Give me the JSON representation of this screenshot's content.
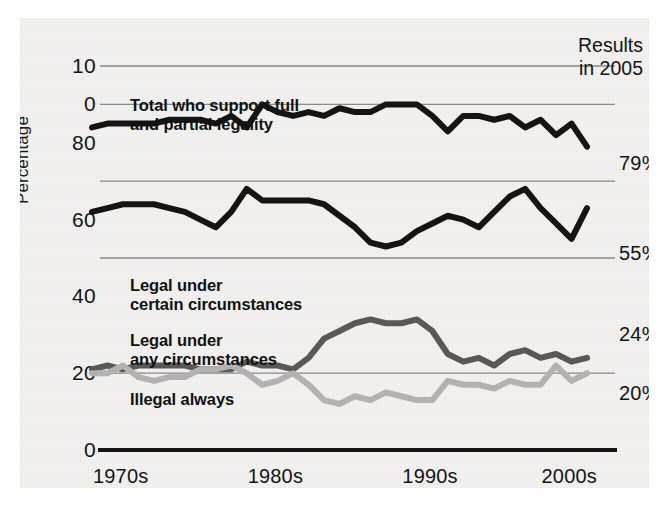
{
  "annotation": {
    "results_note": "Results\nin 2005"
  },
  "chart_data": {
    "type": "line",
    "title": "",
    "subtitle": "",
    "xlabel": "",
    "ylabel": "Percentage",
    "grid": true,
    "legend_position": "inline-labels",
    "xlim": [
      1973,
      2005
    ],
    "ylim": [
      0,
      100
    ],
    "x_tick_labels": [
      "1970s",
      "1980s",
      "1990s",
      "2000s"
    ],
    "x_tick_values": [
      1975,
      1985,
      1995,
      2004
    ],
    "y_tick_labels": [
      "10",
      "0",
      "80",
      "60",
      "40",
      "20",
      "0"
    ],
    "y_tick_values": [
      100,
      90,
      80,
      60,
      40,
      20,
      0
    ],
    "gridline_values": [
      100,
      90,
      70,
      50,
      20,
      0
    ],
    "x": [
      1973,
      1974,
      1975,
      1976,
      1977,
      1978,
      1979,
      1980,
      1981,
      1982,
      1983,
      1984,
      1985,
      1986,
      1987,
      1988,
      1989,
      1990,
      1991,
      1992,
      1993,
      1994,
      1995,
      1996,
      1997,
      1998,
      1999,
      2000,
      2001,
      2002,
      2003,
      2004,
      2005
    ],
    "series": [
      {
        "name": "Total who support full and partial legality",
        "color": "#141414",
        "width": 6,
        "end_label": "79%",
        "end_value": 79,
        "label_text": "Total who support full\nand partial legality",
        "values": [
          84,
          85,
          85,
          85,
          85,
          86,
          86,
          86,
          85,
          87,
          84,
          90,
          88,
          87,
          88,
          87,
          89,
          88,
          88,
          90,
          90,
          90,
          87,
          83,
          87,
          87,
          86,
          87,
          84,
          86,
          82,
          85,
          79
        ]
      },
      {
        "name": "Legal under certain circumstances",
        "color": "#141414",
        "width": 6,
        "end_label": "55%",
        "end_value": 55,
        "label_text": "Legal under\ncertain circumstances",
        "values": [
          62,
          63,
          64,
          64,
          64,
          63,
          62,
          60,
          58,
          62,
          68,
          65,
          65,
          65,
          65,
          64,
          61,
          58,
          54,
          53,
          54,
          57,
          59,
          61,
          60,
          58,
          62,
          66,
          68,
          63,
          59,
          55,
          63
        ]
      },
      {
        "name": "Legal under any circumstances",
        "color": "#595959",
        "width": 6,
        "end_label": "24%",
        "end_value": 24,
        "label_text": "Legal under\nany circumstances",
        "values": [
          21,
          22,
          21,
          22,
          22,
          22,
          22,
          21,
          21,
          21,
          23,
          22,
          22,
          21,
          24,
          29,
          31,
          33,
          34,
          33,
          33,
          34,
          31,
          25,
          23,
          24,
          22,
          25,
          26,
          24,
          25,
          23,
          24
        ]
      },
      {
        "name": "Illegal always",
        "color": "#b3b3b3",
        "width": 6,
        "end_label": "20%",
        "end_value": 20,
        "label_text": "Illegal always",
        "values": [
          20,
          20,
          22,
          19,
          18,
          19,
          19,
          21,
          21,
          22,
          20,
          17,
          18,
          20,
          17,
          13,
          12,
          14,
          13,
          15,
          14,
          13,
          13,
          18,
          17,
          17,
          16,
          18,
          17,
          17,
          22,
          18,
          20
        ]
      }
    ]
  }
}
